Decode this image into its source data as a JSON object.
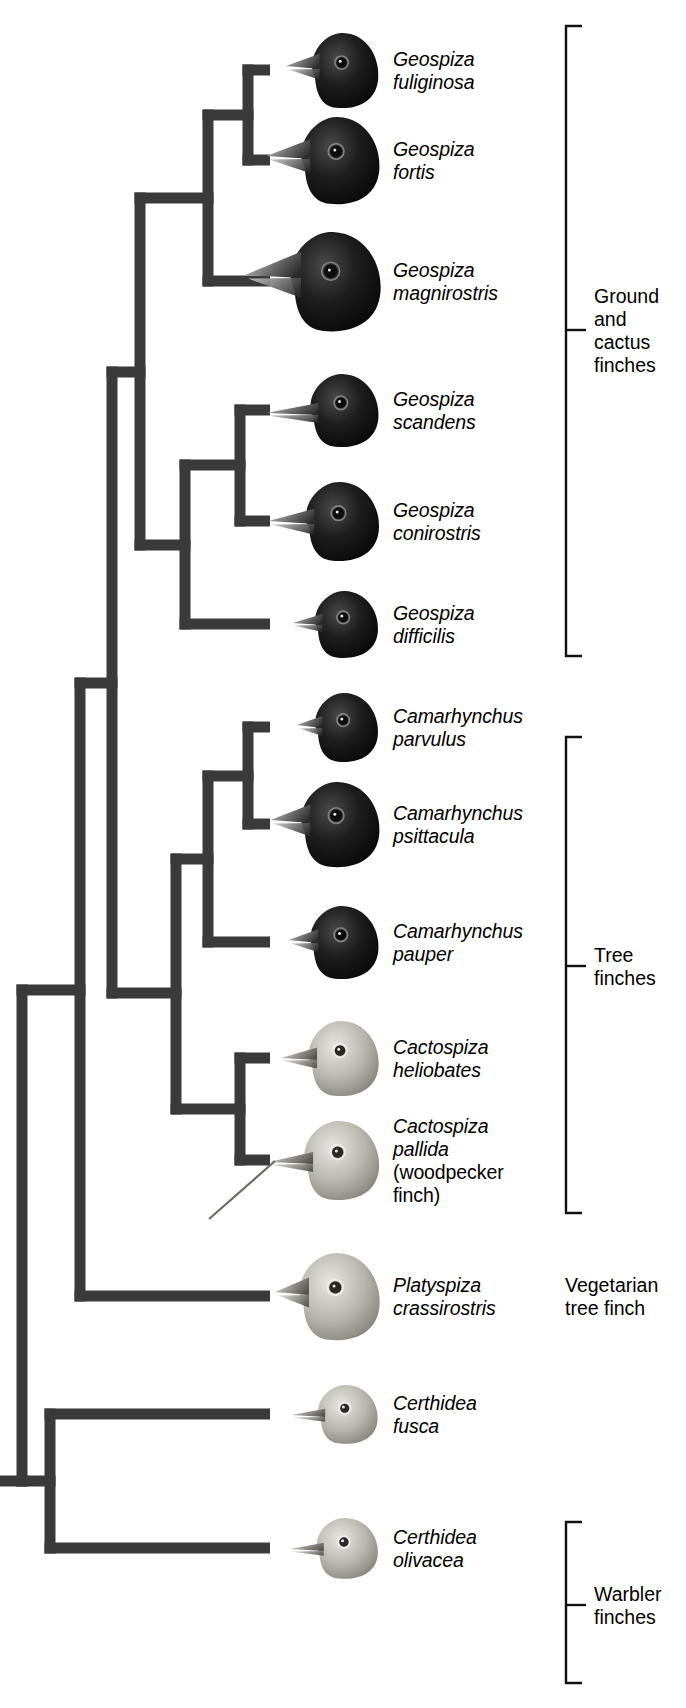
{
  "figure": {
    "kind": "phylogenetic-cladogram",
    "background": "#ffffff",
    "branch_color": "#3a3a3a",
    "bracket_color": "#111111",
    "text_color": "#000000"
  },
  "taxa": [
    {
      "id": "fuliginosa",
      "genus": "Geospiza",
      "species": "fuliginosa",
      "common": "",
      "y": 70,
      "plumage": "dark",
      "beak": "medium-conical"
    },
    {
      "id": "fortis",
      "genus": "Geospiza",
      "species": "fortis",
      "common": "",
      "y": 160,
      "plumage": "dark",
      "beak": "large-conical"
    },
    {
      "id": "magnirostris",
      "genus": "Geospiza",
      "species": "magnirostris",
      "common": "",
      "y": 281,
      "plumage": "dark",
      "beak": "massive"
    },
    {
      "id": "scandens",
      "genus": "Geospiza",
      "species": "scandens",
      "common": "",
      "y": 410,
      "plumage": "dark",
      "beak": "long-pointed"
    },
    {
      "id": "conirostris",
      "genus": "Geospiza",
      "species": "conirostris",
      "common": "",
      "y": 521,
      "plumage": "dark",
      "beak": "long-conical"
    },
    {
      "id": "difficilis",
      "genus": "Geospiza",
      "species": "difficilis",
      "common": "",
      "y": 624,
      "plumage": "dark",
      "beak": "small-pointed"
    },
    {
      "id": "parvulus",
      "genus": "Camarhynchus",
      "species": "parvulus",
      "common": "",
      "y": 727,
      "plumage": "dark",
      "beak": "small-stubby"
    },
    {
      "id": "psittacula",
      "genus": "Camarhynchus",
      "species": "psittacula",
      "common": "",
      "y": 824,
      "plumage": "dark",
      "beak": "parrot-like"
    },
    {
      "id": "pauper",
      "genus": "Camarhynchus",
      "species": "pauper",
      "common": "",
      "y": 942,
      "plumage": "dark",
      "beak": "medium-stubby"
    },
    {
      "id": "heliobates",
      "genus": "Cactospiza",
      "species": "heliobates",
      "common": "",
      "y": 1058,
      "plumage": "pale",
      "beak": "medium-pointed"
    },
    {
      "id": "pallida",
      "genus": "Cactospiza",
      "species": "pallida",
      "common": "(woodpecker finch)",
      "y": 1160,
      "plumage": "pale",
      "beak": "long-tool"
    },
    {
      "id": "crassirostris",
      "genus": "Platyspiza",
      "species": "crassirostris",
      "common": "",
      "y": 1296,
      "plumage": "pale",
      "beak": "thick-blunt"
    },
    {
      "id": "fusca",
      "genus": "Certhidea",
      "species": "fusca",
      "common": "",
      "y": 1414,
      "plumage": "pale",
      "beak": "slender-warbler"
    },
    {
      "id": "olivacea",
      "genus": "Certhidea",
      "species": "olivacea",
      "common": "",
      "y": 1548,
      "plumage": "pale",
      "beak": "slender-warbler"
    }
  ],
  "groups": [
    {
      "id": "ground-cactus",
      "label": "Ground\nand\ncactus\nfinches",
      "bracketed": true,
      "bracket_top": 26,
      "bracket_bottom": 656,
      "tick_y": 330,
      "x": 566
    },
    {
      "id": "tree",
      "label": "Tree\nfinches",
      "bracketed": true,
      "bracket_top": 737,
      "bracket_bottom": 1213,
      "tick_y": 966,
      "x": 566
    },
    {
      "id": "vegetarian",
      "label": "Vegetarian\ntree finch",
      "bracketed": false,
      "bracket_top": 0,
      "bracket_bottom": 0,
      "tick_y": 1296,
      "x": 566
    },
    {
      "id": "warbler",
      "label": "Warbler\nfinches",
      "bracketed": true,
      "bracket_top": 1522,
      "bracket_bottom": 1683,
      "tick_y": 1605,
      "x": 566
    }
  ],
  "tree_nodes": [
    {
      "id": "n_fuli_fort",
      "x": 248,
      "children_y": [
        70,
        160
      ]
    },
    {
      "id": "n_magni",
      "x": 208,
      "children_y": [
        115,
        281
      ]
    },
    {
      "id": "n_scan_coni",
      "x": 240,
      "children_y": [
        410,
        521
      ]
    },
    {
      "id": "n_diff",
      "x": 185,
      "children_y": [
        465,
        624
      ]
    },
    {
      "id": "n_ground",
      "x": 140,
      "children_y": [
        198,
        545
      ]
    },
    {
      "id": "n_parv_psit",
      "x": 248,
      "children_y": [
        727,
        824
      ]
    },
    {
      "id": "n_pauper",
      "x": 208,
      "children_y": [
        776,
        942
      ]
    },
    {
      "id": "n_heli_pall",
      "x": 240,
      "children_y": [
        1058,
        1160
      ]
    },
    {
      "id": "n_tree",
      "x": 176,
      "children_y": [
        859,
        1109
      ]
    },
    {
      "id": "n_ground_tree",
      "x": 112,
      "children_y": [
        372,
        993
      ]
    },
    {
      "id": "n_veg",
      "x": 80,
      "children_y": [
        683,
        1296
      ]
    },
    {
      "id": "n_warbler",
      "x": 50,
      "children_y": [
        1414,
        1548
      ]
    },
    {
      "id": "n_root",
      "x": 22,
      "children_y": [
        990,
        1481
      ]
    }
  ],
  "tip_x": 270,
  "label_x": 393,
  "root_stub": {
    "x_from": 0,
    "x_to": 22,
    "y": 1481
  }
}
